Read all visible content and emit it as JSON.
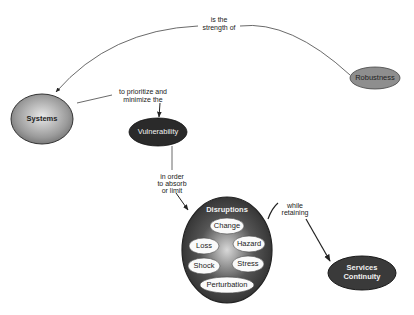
{
  "diagram": {
    "type": "concept-map",
    "nodes": {
      "robustness": {
        "label": "Robustness",
        "fill": "#8c8c8c"
      },
      "systems": {
        "label": "Systems",
        "fill": "#9a9a9a"
      },
      "vulnerability": {
        "label": "Vulnerability",
        "fill": "#2a2a2a"
      },
      "disruptions": {
        "label": "Disruptions",
        "fill": "#3a3a3a",
        "children": [
          "Change",
          "Loss",
          "Hazard",
          "Shock",
          "Stress",
          "Perturbation"
        ]
      },
      "services_continuity": {
        "label_line1": "Services",
        "label_line2": "Continuity",
        "fill": "#3a3a3a"
      }
    },
    "edges": {
      "robustness_systems": {
        "line1": "is the",
        "line2": "strength of"
      },
      "systems_vulnerability": {
        "line1": "to prioritize and",
        "line2": "minimize the"
      },
      "vulnerability_disruptions": {
        "line1": "in order",
        "line2": "to absorb",
        "line3": "or limit"
      },
      "disruptions_services": {
        "line1": "while",
        "line2": "retaining"
      }
    }
  }
}
